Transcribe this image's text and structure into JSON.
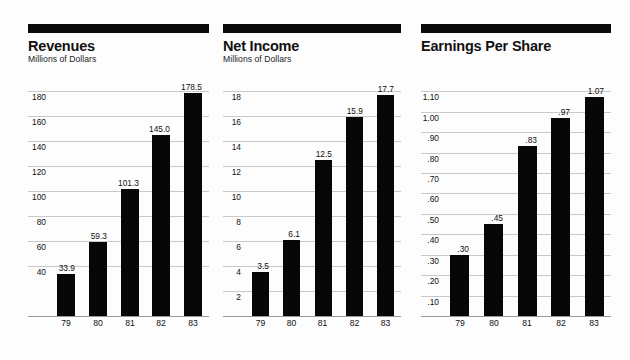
{
  "chart_data": [
    {
      "type": "bar",
      "panel_id": "revenues",
      "title": "Revenues",
      "subtitle": "Millions of Dollars",
      "xlabel": "",
      "ylabel": "Millions of Dollars",
      "categories": [
        "79",
        "80",
        "81",
        "82",
        "83"
      ],
      "values": [
        33.9,
        59.3,
        101.3,
        145.0,
        178.5
      ],
      "value_labels": [
        "33.9",
        "59.3",
        "101.3",
        "145.0",
        "178.5"
      ],
      "yticks": [
        40,
        60,
        80,
        100,
        120,
        140,
        160,
        180
      ],
      "ytick_labels": [
        "40",
        "60",
        "80",
        "100",
        "120",
        "140",
        "160",
        "180"
      ],
      "ylim": [
        0,
        188
      ],
      "grid": true,
      "legend": "none",
      "bar_color": "#070707"
    },
    {
      "type": "bar",
      "panel_id": "net-income",
      "title": "Net Income",
      "subtitle": "Millions of Dollars",
      "xlabel": "",
      "ylabel": "Millions of Dollars",
      "categories": [
        "79",
        "80",
        "81",
        "82",
        "83"
      ],
      "values": [
        3.5,
        6.1,
        12.5,
        15.9,
        17.7
      ],
      "value_labels": [
        "3.5",
        "6.1",
        "12.5",
        "15.9",
        "17.7"
      ],
      "yticks": [
        2,
        4,
        6,
        8,
        10,
        12,
        14,
        16,
        18
      ],
      "ytick_labels": [
        "2",
        "4",
        "6",
        "8",
        "10",
        "12",
        "14",
        "16",
        "18"
      ],
      "ylim": [
        0,
        18.8
      ],
      "grid": true,
      "legend": "none",
      "bar_color": "#070707"
    },
    {
      "type": "bar",
      "panel_id": "earnings-per-share",
      "title": "Earnings Per Share",
      "subtitle": "",
      "xlabel": "",
      "ylabel": "",
      "categories": [
        "79",
        "80",
        "81",
        "82",
        "83"
      ],
      "values": [
        0.3,
        0.45,
        0.83,
        0.97,
        1.07
      ],
      "value_labels": [
        ".30",
        ".45",
        ".83",
        ".97",
        "1.07"
      ],
      "yticks": [
        0.1,
        0.2,
        0.3,
        0.4,
        0.5,
        0.6,
        0.7,
        0.8,
        0.9,
        1.0,
        1.1
      ],
      "ytick_labels": [
        ".10",
        ".20",
        ".30",
        ".40",
        ".50",
        ".60",
        ".70",
        ".80",
        ".90",
        "1.00",
        "1.10"
      ],
      "ylim": [
        0,
        1.15
      ],
      "grid": true,
      "legend": "none",
      "bar_color": "#070707"
    }
  ],
  "colors": {
    "bar": "#070707",
    "gridline": "#c9c9c9",
    "header_bar": "#0a0a0a",
    "background": "#fdfdfd",
    "text": "#111111"
  }
}
